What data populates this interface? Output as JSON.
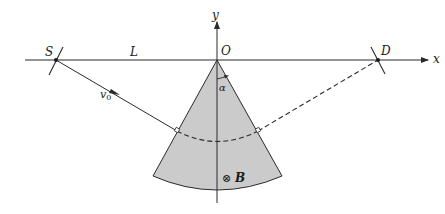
{
  "labels": {
    "source": "S",
    "detector": "D",
    "origin": "O",
    "distance": "L",
    "x_axis": "x",
    "y_axis": "y",
    "velocity_main": "v",
    "velocity_sub": "0",
    "angle": "α",
    "field_symbol": "⊗",
    "field": "B"
  },
  "colors": {
    "sector_fill": "#cbcbcb",
    "line": "#2a2a2a",
    "background": "#ffffff"
  },
  "geometry": {
    "apex": [
      217,
      60
    ],
    "source_point": [
      56,
      60
    ],
    "detector_point": [
      378,
      60
    ],
    "entry_point": [
      177,
      131
    ],
    "exit_point": [
      258,
      131
    ]
  }
}
